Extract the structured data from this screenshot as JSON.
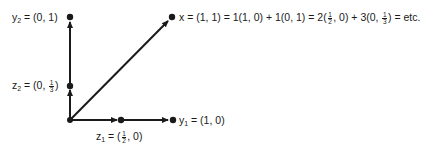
{
  "diagram": {
    "colors": {
      "ink": "#1a1a1a",
      "background": "#ffffff"
    },
    "origin": {
      "x": 70,
      "y": 120
    },
    "points": {
      "y2": {
        "name": "y",
        "sub": "2",
        "coords": "(0, 1)",
        "px": [
          70,
          17
        ]
      },
      "z2": {
        "name": "z",
        "sub": "2",
        "coords_prefix": "(0, ",
        "frac_n": "1",
        "frac_d": "3",
        "coords_suffix": ")",
        "px": [
          70,
          86
        ]
      },
      "z1": {
        "name": "z",
        "sub": "1",
        "coords_prefix": "(",
        "frac_n": "1",
        "frac_d": "2",
        "coords_suffix": ", 0)",
        "px": [
          121,
          120
        ]
      },
      "y1": {
        "name": "y",
        "sub": "1",
        "coords": "(1, 0)",
        "px": [
          173,
          120
        ]
      },
      "x": {
        "name": "x",
        "px": [
          172,
          17
        ]
      }
    },
    "labels": {
      "y2": {
        "var": "y",
        "sub": "2",
        "eq": " = (0, 1)"
      },
      "z2": {
        "var": "z",
        "sub": "2",
        "eq": " = (0, ",
        "fn": "1",
        "fd": "3",
        "tail": ")"
      },
      "z1": {
        "var": "z",
        "sub": "1",
        "eq": " = (",
        "fn": "1",
        "fd": "2",
        "tail": ", 0)"
      },
      "y1": {
        "var": "y",
        "sub": "1",
        "eq": " = (1, 0)"
      },
      "x": {
        "part1": "x = (1, 1) = 1(1, 0) + 1(0, 1) = 2(",
        "f1n": "1",
        "f1d": "2",
        "part2": ", 0) + 3(0, ",
        "f2n": "1",
        "f2d": "3",
        "part3": ") = etc."
      }
    }
  }
}
